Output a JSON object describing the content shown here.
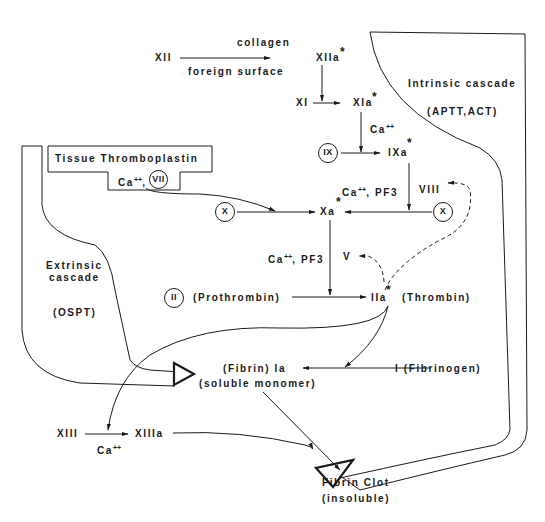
{
  "diagram": {
    "type": "coagulation cascade",
    "regions": {
      "intrinsic": {
        "title": "Intrinsic cascade",
        "test": "(APTT,ACT)"
      },
      "extrinsic": {
        "title_line1": "Extrinsic",
        "title_line2": "cascade",
        "test": "(OSPT)"
      },
      "tissue_box": {
        "title": "Tissue Thromboplastin",
        "cofactor": "Ca",
        "cofactor_sup": "++",
        "factor": "VII"
      }
    },
    "nodes": {
      "xii": "XII",
      "collagen": "collagen",
      "foreign_surface": "foreign surface",
      "xiia": "XIIa",
      "xi": "XI",
      "xia": "XIa",
      "ca1": "Ca",
      "ca_sup": "++",
      "ix": "IX",
      "ixa": "IXa",
      "ca_pf3_1": "Ca",
      "pf3_1": ", PF3",
      "viii": "VIII",
      "x_left": "X",
      "xa": "Xa",
      "x_right": "X",
      "ca_pf3_2": "Ca",
      "pf3_2": ", PF3",
      "v": "V",
      "ii": "II",
      "prothrombin": "(Prothrombin)",
      "iia": "IIa",
      "thrombin": "(Thrombin)",
      "fibrin_ia": "(Fibrin) Ia",
      "soluble_monomer": "(soluble monomer)",
      "fibrinogen": "I (Fibrinogen)",
      "xiii": "XIII",
      "xiiia": "XIIIa",
      "ca3": "Ca",
      "fibrin_clot": "Fibrin Clot",
      "insoluble": "(insoluble)",
      "activated_marker": "*"
    },
    "edges": [
      {
        "from": "XII",
        "to": "XIIa",
        "label_above": "collagen",
        "label_below": "foreign surface"
      },
      {
        "from": "XIIa",
        "to": "XI->XIa"
      },
      {
        "from": "XI",
        "to": "XIa"
      },
      {
        "from": "XIa",
        "to": "IX->IXa",
        "cofactor": "Ca++"
      },
      {
        "from": "IX",
        "to": "IXa"
      },
      {
        "from": "IXa",
        "to": "X->Xa",
        "cofactor": "Ca++, PF3, VIII"
      },
      {
        "from": "Tissue Thromboplastin/VII",
        "to": "X->Xa"
      },
      {
        "from": "X (left)",
        "to": "Xa"
      },
      {
        "from": "X (right)",
        "to": "Xa"
      },
      {
        "from": "Xa",
        "to": "II->IIa",
        "cofactor": "Ca++, PF3, V"
      },
      {
        "from": "II",
        "to": "IIa"
      },
      {
        "from": "IIa",
        "to": "VIII",
        "style": "dashed feedback"
      },
      {
        "from": "IIa",
        "to": "V",
        "style": "dashed feedback"
      },
      {
        "from": "IIa",
        "to": "I->Ia"
      },
      {
        "from": "IIa",
        "to": "XIII->XIIIa"
      },
      {
        "from": "I",
        "to": "Ia"
      },
      {
        "from": "XIII",
        "to": "XIIIa",
        "cofactor": "Ca++"
      },
      {
        "from": "Ia",
        "to": "Fibrin Clot"
      },
      {
        "from": "XIIIa",
        "to": "Fibrin Clot"
      },
      {
        "from": "Extrinsic cascade",
        "to": "Ia",
        "style": "open arrow"
      },
      {
        "from": "Intrinsic cascade",
        "to": "Ia",
        "style": "open arrow"
      }
    ],
    "colors": {
      "ink": "#1a1a1a",
      "background": "#ffffff"
    }
  }
}
